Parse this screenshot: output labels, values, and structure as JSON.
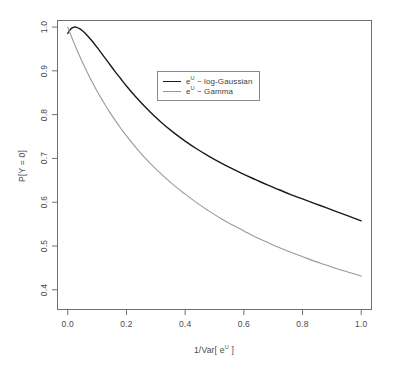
{
  "chart_data": {
    "type": "line",
    "title": "",
    "xlabel": "1/Var[ e^U ]",
    "xlabel_parts": {
      "prefix": "1/Var[ e",
      "sup": "U",
      "suffix": " ]"
    },
    "ylabel": "P[Y = 0]",
    "ylabel_parts": {
      "prefix": "P[Y",
      "sub": "",
      "suffix": " = 0]"
    },
    "xlim": [
      -0.035,
      1.035
    ],
    "ylim": [
      0.355,
      1.015
    ],
    "xticks": [
      0.0,
      0.2,
      0.4,
      0.6,
      0.8,
      1.0
    ],
    "xtick_labels": [
      "0.0",
      "0.2",
      "0.4",
      "0.6",
      "0.8",
      "1.0"
    ],
    "yticks": [
      0.4,
      0.5,
      0.6,
      0.7,
      0.8,
      0.9,
      1.0
    ],
    "ytick_labels": [
      "0.4",
      "0.5",
      "0.6",
      "0.7",
      "0.8",
      "0.9",
      "1.0"
    ],
    "grid": false,
    "frame": true,
    "legend_position": "upper-center",
    "x": [
      0.0,
      0.01,
      0.02,
      0.025,
      0.03,
      0.04,
      0.05,
      0.06,
      0.08,
      0.1,
      0.12,
      0.14,
      0.16,
      0.18,
      0.2,
      0.24,
      0.28,
      0.32,
      0.36,
      0.4,
      0.44,
      0.48,
      0.52,
      0.56,
      0.6,
      0.64,
      0.68,
      0.72,
      0.76,
      0.8,
      0.84,
      0.88,
      0.92,
      0.96,
      1.0
    ],
    "series": [
      {
        "name": "e^U ~ log-Gaussian",
        "name_parts": {
          "prefix": "e",
          "sup": "U",
          "suffix": " ~ log-Gaussian"
        },
        "color": "#1a1a1a",
        "linewidth": 1.4,
        "values": [
          0.9855,
          0.9955,
          0.9995,
          1.0,
          0.9995,
          0.9965,
          0.9915,
          0.9855,
          0.9705,
          0.9535,
          0.9355,
          0.9175,
          0.8995,
          0.8825,
          0.8655,
          0.8345,
          0.8065,
          0.7815,
          0.7595,
          0.7395,
          0.7215,
          0.7055,
          0.6905,
          0.6765,
          0.6635,
          0.6515,
          0.6395,
          0.6285,
          0.6175,
          0.6075,
          0.5975,
          0.5875,
          0.5775,
          0.5675,
          0.5575
        ]
      },
      {
        "name": "e^U ~ Gamma",
        "name_parts": {
          "prefix": "e",
          "sup": "U",
          "suffix": " ~ Gamma"
        },
        "color": "#9a9a9a",
        "linewidth": 1.1,
        "values": [
          1.0,
          0.9825,
          0.9655,
          0.9575,
          0.9495,
          0.9345,
          0.9195,
          0.9055,
          0.8785,
          0.8535,
          0.8305,
          0.8085,
          0.7885,
          0.7695,
          0.7515,
          0.7185,
          0.6895,
          0.6635,
          0.6395,
          0.6185,
          0.5985,
          0.5805,
          0.5635,
          0.5485,
          0.5345,
          0.5205,
          0.5085,
          0.4965,
          0.4855,
          0.4755,
          0.4655,
          0.4565,
          0.4475,
          0.4395,
          0.4315
        ]
      }
    ],
    "series_endpoints": {
      "log_gaussian_at_x1": 0.51,
      "gamma_at_x1": 0.37
    }
  },
  "legend": {
    "items": [
      {
        "label": "e^U ~ log-Gaussian",
        "prefix": "e",
        "sup": "U",
        "suffix": " ~ log-Gaussian"
      },
      {
        "label": "e^U ~ Gamma",
        "prefix": "e",
        "sup": "U",
        "suffix": " ~ Gamma"
      }
    ]
  },
  "axes": {
    "x_title_prefix": "1/Var[ e",
    "x_title_sup": "U",
    "x_title_suffix": " ]",
    "y_title_prefix": "P[Y",
    "y_title_suffix": " = 0]"
  }
}
